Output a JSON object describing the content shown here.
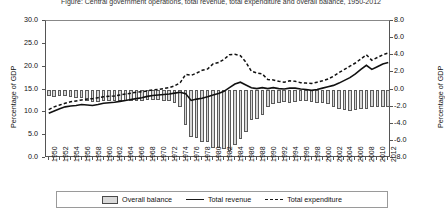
{
  "title": "Figure: Central government operations, total revenue, total expenditure and overall balance, 1950-2012",
  "axes": {
    "left_title": "Percentage of GDP",
    "right_title": "Percentage of GDP",
    "left_ticks": [
      "30.0",
      "25.0",
      "20.0",
      "15.0",
      "10.0",
      "5.0",
      "0.0"
    ],
    "right_ticks": [
      "8.0",
      "6.0",
      "4.0",
      "2.0",
      "0.0",
      "-2.0",
      "-4.0",
      "-6.0",
      "-8.0"
    ]
  },
  "legend": {
    "items": [
      {
        "label": "Overall balance",
        "marker": "bar-swatch"
      },
      {
        "label": "Total revenue",
        "marker": "solid-line"
      },
      {
        "label": "Total expenditure",
        "marker": "dashed-line"
      }
    ]
  },
  "chart_data": {
    "type": "bar",
    "xlabel": "",
    "ylabel": "Percentage of GDP",
    "ylim": [
      0,
      30
    ],
    "y2lim": [
      -8,
      8
    ],
    "y2label": "Percentage of GDP",
    "grid": false,
    "legend_position": "bottom",
    "x": [
      1950,
      1951,
      1952,
      1953,
      1954,
      1955,
      1956,
      1957,
      1958,
      1959,
      1960,
      1961,
      1962,
      1963,
      1964,
      1965,
      1966,
      1967,
      1968,
      1969,
      1970,
      1971,
      1972,
      1973,
      1974,
      1975,
      1976,
      1977,
      1978,
      1979,
      1980,
      1981,
      1982,
      1983,
      1984,
      1985,
      1986,
      1987,
      1988,
      1989,
      1990,
      1991,
      1992,
      1993,
      1994,
      1995,
      1996,
      1997,
      1998,
      1999,
      2000,
      2001,
      2002,
      2003,
      2004,
      2005,
      2006,
      2007,
      2008,
      2009,
      2010,
      2011,
      2012
    ],
    "tick_label_years": [
      1950,
      1952,
      1954,
      1956,
      1958,
      1960,
      1962,
      1964,
      1966,
      1968,
      1970,
      1972,
      1974,
      1976,
      1978,
      1980,
      1982,
      1984,
      1986,
      1988,
      1990,
      1992,
      1994,
      1996,
      1998,
      2000,
      2002,
      2004,
      2006,
      2008,
      2010,
      2012
    ],
    "series": [
      {
        "name": "Total revenue",
        "axis": "left",
        "style": "solid-line",
        "values": [
          9.8,
          10.3,
          10.8,
          11.2,
          11.4,
          11.5,
          11.7,
          11.6,
          11.5,
          11.7,
          12.0,
          12.1,
          12.2,
          12.4,
          12.6,
          12.8,
          13.0,
          13.2,
          13.5,
          13.7,
          13.8,
          13.9,
          14.0,
          14.2,
          14.4,
          14.1,
          12.6,
          12.9,
          13.1,
          13.4,
          13.8,
          14.1,
          14.6,
          15.4,
          16.2,
          16.6,
          16.0,
          15.4,
          15.2,
          15.4,
          15.2,
          15.4,
          15.2,
          15.1,
          15.3,
          15.3,
          15.1,
          15.0,
          14.8,
          15.0,
          15.3,
          15.6,
          15.9,
          16.4,
          17.0,
          17.6,
          18.4,
          19.4,
          20.3,
          19.4,
          20.0,
          20.6,
          20.9
        ]
      },
      {
        "name": "Total expenditure",
        "axis": "left",
        "style": "dashed-line",
        "values": [
          10.6,
          11.2,
          11.6,
          12.0,
          12.3,
          12.5,
          12.7,
          12.9,
          13.0,
          13.2,
          13.4,
          13.5,
          13.6,
          13.8,
          14.0,
          14.2,
          14.4,
          14.5,
          14.7,
          14.9,
          15.0,
          15.2,
          15.4,
          15.8,
          16.5,
          18.3,
          18.1,
          18.6,
          19.2,
          19.5,
          20.6,
          20.9,
          21.6,
          22.6,
          22.7,
          22.4,
          21.0,
          19.0,
          18.6,
          18.4,
          17.2,
          17.1,
          16.8,
          16.6,
          16.9,
          16.8,
          16.5,
          16.4,
          16.3,
          16.6,
          16.9,
          17.3,
          17.9,
          18.7,
          19.4,
          20.1,
          20.8,
          21.7,
          22.6,
          21.4,
          22.0,
          22.6,
          23.0
        ]
      },
      {
        "name": "Overall balance",
        "axis": "right",
        "style": "bar",
        "values": [
          -0.8,
          -0.9,
          -0.8,
          -0.8,
          -0.9,
          -1.0,
          -1.0,
          -1.3,
          -1.5,
          -1.5,
          -1.4,
          -1.4,
          -1.4,
          -1.4,
          -1.4,
          -1.4,
          -1.4,
          -1.3,
          -1.2,
          -1.2,
          -1.2,
          -1.3,
          -1.4,
          -1.6,
          -2.1,
          -4.2,
          -5.5,
          -5.7,
          -6.1,
          -6.1,
          -6.8,
          -6.8,
          -7.0,
          -7.2,
          -6.5,
          -5.8,
          -5.0,
          -3.6,
          -3.4,
          -3.0,
          -2.0,
          -1.7,
          -1.6,
          -1.5,
          -1.6,
          -1.5,
          -1.4,
          -1.4,
          -1.5,
          -1.6,
          -1.6,
          -1.7,
          -2.0,
          -2.3,
          -2.4,
          -2.5,
          -2.4,
          -2.3,
          -2.3,
          -2.0,
          -2.0,
          -2.0,
          -2.1
        ]
      }
    ]
  }
}
